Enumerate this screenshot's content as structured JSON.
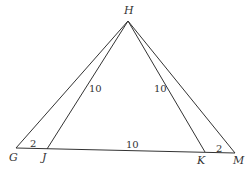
{
  "diagram": {
    "points": {
      "H": {
        "label": "H",
        "x": 128,
        "y": 21
      },
      "G": {
        "label": "G",
        "x": 16,
        "y": 148
      },
      "J": {
        "label": "J",
        "x": 47,
        "y": 149
      },
      "K": {
        "label": "K",
        "x": 205,
        "y": 152
      },
      "M": {
        "label": "M",
        "x": 235,
        "y": 153
      }
    },
    "segments": [
      {
        "from": "H",
        "to": "G"
      },
      {
        "from": "H",
        "to": "J",
        "length_label": "10"
      },
      {
        "from": "H",
        "to": "K",
        "length_label": "10"
      },
      {
        "from": "H",
        "to": "M"
      },
      {
        "from": "G",
        "to": "M"
      }
    ],
    "measures": {
      "HJ": "10",
      "HK": "10",
      "JK": "10",
      "GJ": "2",
      "KM": "2"
    },
    "line_color": "#333333"
  }
}
